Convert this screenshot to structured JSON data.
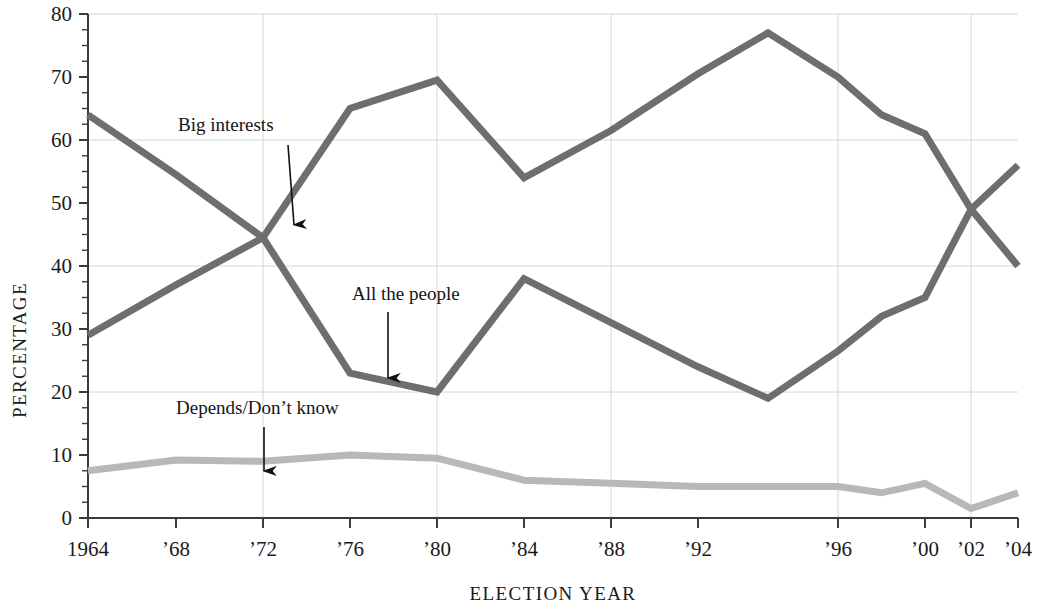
{
  "chart_data": {
    "type": "line",
    "title": "",
    "xlabel": "ELECTION YEAR",
    "ylabel": "PERCENTAGE",
    "ylim": [
      0,
      80
    ],
    "ytick_values": [
      0,
      10,
      20,
      30,
      40,
      50,
      60,
      70,
      80
    ],
    "ytick_labels": [
      "0",
      "10",
      "20",
      "30",
      "40",
      "50",
      "60",
      "70",
      "80"
    ],
    "yminor_step": 2.5,
    "gridlines": [
      "y:20",
      "y:40",
      "y:60",
      "y:80",
      "x:1972",
      "x:1980",
      "x:1988",
      "x:1996",
      "x:2002"
    ],
    "grid": true,
    "legend_position": "inline-annotations",
    "x": [
      1964,
      1968,
      1972,
      1976,
      1980,
      1984,
      1988,
      1992,
      1994,
      1996,
      1998,
      2000,
      2002,
      2004
    ],
    "xtick_years": [
      1964,
      1968,
      1972,
      1976,
      1980,
      1984,
      1988,
      1992,
      1996,
      2000,
      2002,
      2004
    ],
    "xtick_labels": [
      "1964",
      "’68",
      "’72",
      "’76",
      "’80",
      "’84",
      "’88",
      "’92",
      "’96",
      "’00",
      "’02",
      "’04"
    ],
    "series": [
      {
        "name": "Big interests",
        "color": "#6e6e6e",
        "values": [
          64,
          54.5,
          44.5,
          65,
          69.5,
          54,
          61.5,
          70.5,
          77,
          70,
          64,
          61,
          49,
          40
        ]
      },
      {
        "name": "All the people",
        "color": "#6e6e6e",
        "values": [
          29,
          37,
          44.5,
          23,
          20,
          38,
          31,
          24,
          19,
          26.5,
          32,
          35,
          49,
          56
        ]
      },
      {
        "name": "Depends/Don’t know",
        "color": "#b8b8b8",
        "values": [
          7.5,
          9.2,
          9,
          10,
          9.5,
          6,
          5.5,
          5,
          5,
          5,
          4,
          5.5,
          1.5,
          4
        ]
      }
    ],
    "annotations": [
      {
        "label": "Big interests",
        "text_x": 178,
        "text_y": 131,
        "arrow_from_x": 288,
        "arrow_from_y": 145,
        "arrow_to_x": 294,
        "arrow_to_y": 225
      },
      {
        "label": "All the people",
        "text_x": 352,
        "text_y": 300,
        "arrow_from_x": 388,
        "arrow_from_y": 312,
        "arrow_to_x": 388,
        "arrow_to_y": 378
      },
      {
        "label": "Depends/Don’t know",
        "text_x": 176,
        "text_y": 414,
        "arrow_from_x": 264,
        "arrow_from_y": 427,
        "arrow_to_x": 264,
        "arrow_to_y": 471
      }
    ],
    "colors": {
      "line_dark": "#6e6e6e",
      "line_light": "#b8b8b8",
      "axis": "#3c3c3c",
      "grid": "#d6d6d6",
      "text": "#1a1a1a",
      "background": "#ffffff"
    }
  }
}
